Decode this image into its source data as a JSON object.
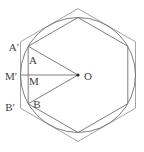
{
  "diagram": {
    "background_color": "#ffffff",
    "colors": {
      "outer_hexagon_stroke": "#9a9a9a",
      "inner_hexagon_stroke": "#6f6f6f",
      "circle_stroke": "#6f6f6f",
      "segment_stroke": "#6f6f6f",
      "center_dot_fill": "#222222",
      "label_color": "#3f3f3f"
    },
    "canvas": {
      "width": 144,
      "height": 152
    },
    "center": {
      "x": 78,
      "y": 75
    },
    "circle_radius": 57.5,
    "inner_hexagon_circumradius": 57.5,
    "outer_hexagon_circumradius": 66.4,
    "hexagon_angles_deg": [
      90,
      30,
      330,
      270,
      210,
      150
    ],
    "points": {
      "O": {
        "x": 78,
        "y": 75
      },
      "A": {
        "x": 28.21,
        "y": 46.25
      },
      "B": {
        "x": 28.21,
        "y": 103.75
      },
      "Ap": {
        "x": 20.5,
        "y": 41.8
      },
      "Bp": {
        "x": 20.5,
        "y": 108.2
      },
      "M": {
        "x": 28.21,
        "y": 75
      },
      "Mp": {
        "x": 20.5,
        "y": 75
      }
    },
    "segments": [
      {
        "name": "segment-OA",
        "from": "O",
        "to": "A"
      },
      {
        "name": "segment-OB",
        "from": "O",
        "to": "B"
      },
      {
        "name": "segment-OMp",
        "from": "O",
        "to": "Mp"
      }
    ],
    "center_dot_radius": 1.6,
    "labels": [
      {
        "name": "label-A-prime",
        "text": "A′",
        "x": 14,
        "y": 47
      },
      {
        "name": "label-A",
        "text": "A",
        "x": 33,
        "y": 60
      },
      {
        "name": "label-M-prime",
        "text": "M′",
        "x": 11,
        "y": 76
      },
      {
        "name": "label-M",
        "text": "M",
        "x": 34,
        "y": 81
      },
      {
        "name": "label-B-prime",
        "text": "B′",
        "x": 10,
        "y": 107
      },
      {
        "name": "label-B",
        "text": "B",
        "x": 37,
        "y": 104
      },
      {
        "name": "label-O",
        "text": "O",
        "x": 88,
        "y": 76
      }
    ]
  }
}
